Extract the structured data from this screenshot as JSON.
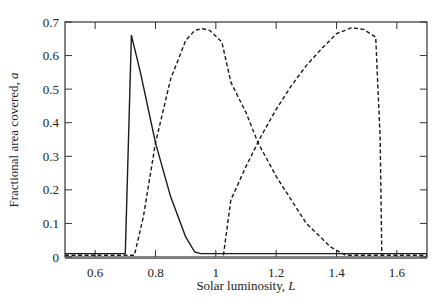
{
  "chart_data": {
    "type": "line",
    "title": "",
    "xlabel": "Solar luminosity, ",
    "xlabel_var": "L",
    "ylabel": "Fractional area covered, ",
    "ylabel_var": "a",
    "xlim": [
      0.5,
      1.7
    ],
    "ylim": [
      0,
      0.7
    ],
    "xticks": [
      0.6,
      0.8,
      1.0,
      1.2,
      1.4,
      1.6
    ],
    "xtick_labels": [
      "0.6",
      "0.8",
      "1",
      "1.2",
      "1.4",
      "1.6"
    ],
    "yticks": [
      0,
      0.1,
      0.2,
      0.3,
      0.4,
      0.5,
      0.6,
      0.7
    ],
    "ytick_labels": [
      "0",
      "0.1",
      "0.2",
      "0.3",
      "0.4",
      "0.5",
      "0.6",
      "0.7"
    ],
    "grid": false,
    "legend": null,
    "series": [
      {
        "name": "solid curve",
        "style": "solid",
        "x": [
          0.5,
          0.7,
          0.72,
          0.75,
          0.8,
          0.85,
          0.9,
          0.93,
          0.95,
          1.7
        ],
        "y": [
          0.01,
          0.01,
          0.66,
          0.55,
          0.34,
          0.18,
          0.06,
          0.015,
          0.01,
          0.01
        ]
      },
      {
        "name": "dashed curve 1",
        "style": "dashed",
        "x": [
          0.5,
          0.73,
          0.76,
          0.8,
          0.85,
          0.9,
          0.93,
          0.955,
          0.98,
          1.02,
          1.05,
          1.1,
          1.14,
          1.2,
          1.3,
          1.38,
          1.43,
          1.7
        ],
        "y": [
          0.005,
          0.005,
          0.12,
          0.34,
          0.53,
          0.645,
          0.675,
          0.68,
          0.675,
          0.64,
          0.52,
          0.43,
          0.34,
          0.24,
          0.1,
          0.03,
          0.005,
          0.005
        ]
      },
      {
        "name": "dashed curve 2",
        "style": "dashed",
        "x": [
          1.025,
          1.05,
          1.1,
          1.15,
          1.2,
          1.25,
          1.3,
          1.35,
          1.4,
          1.45,
          1.49,
          1.53,
          1.545,
          1.55
        ],
        "y": [
          0.005,
          0.17,
          0.27,
          0.36,
          0.44,
          0.51,
          0.57,
          0.62,
          0.665,
          0.683,
          0.678,
          0.655,
          0.35,
          0.005
        ]
      }
    ]
  }
}
